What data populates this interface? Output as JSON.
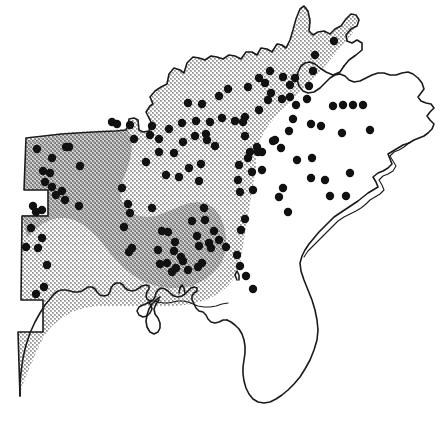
{
  "figure": {
    "name": "species-distribution-map",
    "region": "Southeastern United States",
    "width": 447,
    "height": 440,
    "background_color": "#ffffff",
    "outline_color": "#1a1a1a"
  },
  "legend_implied": {
    "light_shading_label": "peripheral range",
    "dark_shading_label": "core range",
    "dot_label": "collection locality"
  },
  "shading": {
    "light": {
      "name": "light-range-zone",
      "fill": "#cccccc",
      "pattern": "coarse halftone dither",
      "gray_level": "approx 80% luminance"
    },
    "dark": {
      "name": "dark-range-zone",
      "fill": "#a0a0a0",
      "pattern": "dense halftone dither",
      "gray_level": "approx 63% luminance"
    }
  },
  "dots": {
    "radius": 4.2,
    "color": "#111111",
    "count": 144,
    "points": [
      [
        334,
        41
      ],
      [
        315,
        55
      ],
      [
        313,
        71
      ],
      [
        309,
        86
      ],
      [
        307,
        99
      ],
      [
        295,
        78
      ],
      [
        290,
        85
      ],
      [
        283,
        77
      ],
      [
        271,
        93
      ],
      [
        268,
        100
      ],
      [
        265,
        83
      ],
      [
        290,
        97
      ],
      [
        282,
        99
      ],
      [
        270,
        71
      ],
      [
        259,
        78
      ],
      [
        248,
        87
      ],
      [
        228,
        89
      ],
      [
        219,
        96
      ],
      [
        259,
        110
      ],
      [
        245,
        117
      ],
      [
        235,
        121
      ],
      [
        222,
        118
      ],
      [
        210,
        122
      ],
      [
        202,
        104
      ],
      [
        188,
        103
      ],
      [
        182,
        123
      ],
      [
        195,
        136
      ],
      [
        207,
        140
      ],
      [
        215,
        146
      ],
      [
        206,
        134
      ],
      [
        196,
        121
      ],
      [
        183,
        142
      ],
      [
        169,
        129
      ],
      [
        159,
        139
      ],
      [
        152,
        126
      ],
      [
        201,
        164
      ],
      [
        199,
        181
      ],
      [
        189,
        168
      ],
      [
        166,
        175
      ],
      [
        179,
        177
      ],
      [
        159,
        152
      ],
      [
        174,
        153
      ],
      [
        146,
        162
      ],
      [
        112,
        122
      ],
      [
        130,
        125
      ],
      [
        150,
        135
      ],
      [
        134,
        139
      ],
      [
        117,
        124
      ],
      [
        37,
        149
      ],
      [
        66,
        147
      ],
      [
        69,
        147
      ],
      [
        43,
        171
      ],
      [
        50,
        173
      ],
      [
        45,
        182
      ],
      [
        52,
        187
      ],
      [
        56,
        195
      ],
      [
        52,
        158
      ],
      [
        80,
        166
      ],
      [
        33,
        206
      ],
      [
        36,
        212
      ],
      [
        42,
        210
      ],
      [
        31,
        228
      ],
      [
        26,
        247
      ],
      [
        38,
        248
      ],
      [
        42,
        238
      ],
      [
        47,
        265
      ],
      [
        44,
        287
      ],
      [
        36,
        294
      ],
      [
        62,
        191
      ],
      [
        65,
        200
      ],
      [
        79,
        206
      ],
      [
        122,
        188
      ],
      [
        128,
        204
      ],
      [
        130,
        213
      ],
      [
        124,
        227
      ],
      [
        132,
        248
      ],
      [
        129,
        252
      ],
      [
        152,
        208
      ],
      [
        162,
        231
      ],
      [
        168,
        232
      ],
      [
        175,
        242
      ],
      [
        181,
        257
      ],
      [
        183,
        261
      ],
      [
        176,
        268
      ],
      [
        167,
        263
      ],
      [
        172,
        272
      ],
      [
        192,
        221
      ],
      [
        197,
        236
      ],
      [
        199,
        246
      ],
      [
        204,
        208
      ],
      [
        205,
        220
      ],
      [
        209,
        243
      ],
      [
        211,
        248
      ],
      [
        214,
        231
      ],
      [
        202,
        263
      ],
      [
        198,
        267
      ],
      [
        188,
        270
      ],
      [
        174,
        251
      ],
      [
        158,
        250
      ],
      [
        160,
        264
      ],
      [
        243,
        122
      ],
      [
        245,
        136
      ],
      [
        257,
        147
      ],
      [
        250,
        152
      ],
      [
        258,
        152
      ],
      [
        262,
        152
      ],
      [
        248,
        158
      ],
      [
        239,
        165
      ],
      [
        252,
        172
      ],
      [
        262,
        170
      ],
      [
        240,
        192
      ],
      [
        253,
        190
      ],
      [
        273,
        141
      ],
      [
        281,
        148
      ],
      [
        293,
        119
      ],
      [
        289,
        131
      ],
      [
        311,
        124
      ],
      [
        321,
        126
      ],
      [
        343,
        105
      ],
      [
        353,
        105
      ],
      [
        363,
        105
      ],
      [
        333,
        106
      ],
      [
        296,
        105
      ],
      [
        370,
        130
      ],
      [
        342,
        133
      ],
      [
        297,
        160
      ],
      [
        312,
        158
      ],
      [
        311,
        178
      ],
      [
        325,
        180
      ],
      [
        330,
        196
      ],
      [
        346,
        196
      ],
      [
        350,
        173
      ],
      [
        283,
        188
      ],
      [
        279,
        197
      ],
      [
        288,
        212
      ],
      [
        245,
        219
      ],
      [
        241,
        230
      ],
      [
        275,
        140
      ],
      [
        238,
        180
      ],
      [
        240,
        266
      ],
      [
        246,
        276
      ],
      [
        253,
        289
      ],
      [
        237,
        255
      ],
      [
        226,
        247
      ],
      [
        219,
        240
      ]
    ]
  }
}
